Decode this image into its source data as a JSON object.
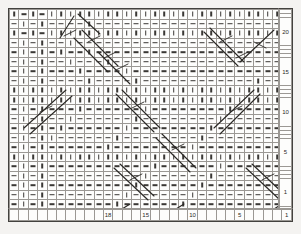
{
  "chart": {
    "type": "stitch-chart",
    "columns": 30,
    "rows": 22,
    "symbols": {
      "purl": "—",
      "knit": "|",
      "blank": ""
    },
    "legend": {
      "purl_label": "purl",
      "knit_label": "knit",
      "cable_label": "cable cross"
    },
    "row_number_labels": [
      "",
      "",
      "20",
      "",
      "",
      "",
      "15",
      "",
      "",
      "",
      "10",
      "",
      "",
      "",
      "5",
      "",
      "",
      "",
      "1",
      "",
      "",
      ""
    ],
    "column_number_labels": [
      "",
      "",
      "",
      "",
      "",
      "",
      "",
      "",
      "",
      "",
      "18",
      "",
      "",
      "",
      "15",
      "",
      "",
      "",
      "",
      "10",
      "",
      "",
      "",
      "",
      "5",
      "",
      "",
      "",
      "",
      "1"
    ],
    "grid": [
      [
        "|",
        "—",
        "|",
        "—",
        "|",
        "|",
        "|",
        "|",
        "|",
        "|",
        "|",
        "|",
        "|",
        "|",
        "|",
        "|",
        "|",
        "|",
        "|",
        "|",
        "|",
        "|",
        "|",
        "|",
        "|",
        "|",
        "|",
        "|",
        "|",
        "|"
      ],
      [
        "—",
        "|",
        "—",
        "|",
        "—",
        "—",
        "—",
        "—",
        "|",
        "—",
        "—",
        "—",
        "—",
        "—",
        "—",
        "—",
        "—",
        "—",
        "—",
        "—",
        "—",
        "—",
        "—",
        "—",
        "—",
        "—",
        "—",
        "—",
        "—",
        "—"
      ],
      [
        "|",
        "—",
        "|",
        "—",
        "|",
        "|",
        "|",
        "|",
        "|",
        "|",
        "|",
        "|",
        "|",
        "|",
        "|",
        "|",
        "|",
        "|",
        "|",
        "|",
        "|",
        "|",
        "|",
        "|",
        "|",
        "|",
        "|",
        "|",
        "|",
        "|"
      ],
      [
        "—",
        "|",
        "—",
        "|",
        "—",
        "—",
        "|",
        "—",
        "—",
        "—",
        "—",
        "—",
        "—",
        "—",
        "—",
        "—",
        "—",
        "—",
        "—",
        "—",
        "—",
        "—",
        "—",
        "—",
        "—",
        "—",
        "—",
        "—",
        "—",
        "—"
      ],
      [
        "—",
        "|",
        "—",
        "|",
        "—",
        "|",
        "—",
        "—",
        "|",
        "—",
        "—",
        "—",
        "—",
        "—",
        "—",
        "—",
        "—",
        "—",
        "—",
        "—",
        "—",
        "—",
        "—",
        "—",
        "—",
        "—",
        "—",
        "—",
        "—",
        "—"
      ],
      [
        "—",
        "|",
        "—",
        "|",
        "—",
        "—",
        "|",
        "—",
        "—",
        "—",
        "|",
        "—",
        "—",
        "—",
        "—",
        "—",
        "—",
        "—",
        "—",
        "—",
        "—",
        "—",
        "—",
        "—",
        "—",
        "—",
        "—",
        "—",
        "—",
        "—"
      ],
      [
        "—",
        "|",
        "—",
        "|",
        "—",
        "—",
        "—",
        "|",
        "—",
        "—",
        "—",
        "—",
        "|",
        "—",
        "—",
        "—",
        "—",
        "—",
        "—",
        "—",
        "—",
        "—",
        "—",
        "—",
        "—",
        "—",
        "—",
        "—",
        "—",
        "—"
      ],
      [
        "—",
        "|",
        "—",
        "|",
        "—",
        "—",
        "—",
        "—",
        "|",
        "—",
        "—",
        "—",
        "—",
        "|",
        "—",
        "—",
        "—",
        "—",
        "—",
        "—",
        "—",
        "—",
        "—",
        "—",
        "—",
        "—",
        "|",
        "—",
        "—",
        "—"
      ],
      [
        "|",
        "|",
        "|",
        "|",
        "|",
        "|",
        "|",
        "|",
        "|",
        "|",
        "|",
        "|",
        "|",
        "|",
        "|",
        "|",
        "|",
        "|",
        "|",
        "|",
        "|",
        "|",
        "|",
        "|",
        "|",
        "|",
        "|",
        "|",
        "|",
        "|"
      ],
      [
        "|",
        "|",
        "|",
        "|",
        "|",
        "|",
        "|",
        "|",
        "|",
        "|",
        "|",
        "|",
        "|",
        "|",
        "|",
        "|",
        "|",
        "|",
        "|",
        "|",
        "|",
        "|",
        "|",
        "|",
        "|",
        "|",
        "|",
        "|",
        "|",
        "|"
      ],
      [
        "—",
        "|",
        "—",
        "|",
        "—",
        "—",
        "—",
        "|",
        "—",
        "—",
        "—",
        "—",
        "—",
        "—",
        "|",
        "—",
        "—",
        "—",
        "—",
        "—",
        "—",
        "—",
        "—",
        "|",
        "—",
        "—",
        "—",
        "—",
        "—",
        "—"
      ],
      [
        "—",
        "|",
        "—",
        "|",
        "—",
        "—",
        "|",
        "—",
        "—",
        "—",
        "—",
        "—",
        "—",
        "|",
        "—",
        "—",
        "—",
        "—",
        "—",
        "—",
        "—",
        "—",
        "|",
        "—",
        "—",
        "—",
        "—",
        "—",
        "—",
        "—"
      ],
      [
        "—",
        "|",
        "—",
        "|",
        "—",
        "|",
        "—",
        "—",
        "—",
        "—",
        "—",
        "—",
        "|",
        "—",
        "—",
        "—",
        "—",
        "—",
        "—",
        "—",
        "—",
        "|",
        "—",
        "—",
        "—",
        "—",
        "—",
        "—",
        "—",
        "—"
      ],
      [
        "—",
        "|",
        "—",
        "|",
        "|",
        "—",
        "—",
        "—",
        "—",
        "—",
        "—",
        "|",
        "—",
        "—",
        "—",
        "—",
        "—",
        "—",
        "—",
        "—",
        "|",
        "—",
        "—",
        "—",
        "—",
        "—",
        "—",
        "—",
        "—",
        "—"
      ],
      [
        "—",
        "|",
        "—",
        "|",
        "—",
        "—",
        "—",
        "—",
        "—",
        "—",
        "|",
        "—",
        "—",
        "—",
        "—",
        "—",
        "—",
        "—",
        "—",
        "|",
        "—",
        "—",
        "—",
        "—",
        "—",
        "—",
        "—",
        "—",
        "—",
        "—"
      ],
      [
        "|",
        "|",
        "|",
        "|",
        "|",
        "|",
        "|",
        "|",
        "|",
        "|",
        "|",
        "|",
        "|",
        "|",
        "|",
        "|",
        "|",
        "|",
        "|",
        "|",
        "|",
        "|",
        "|",
        "|",
        "|",
        "|",
        "|",
        "|",
        "|",
        "|"
      ],
      [
        "—",
        "|",
        "—",
        "|",
        "—",
        "—",
        "—",
        "—",
        "—",
        "—",
        "—",
        "—",
        "—",
        "—",
        "—",
        "|",
        "—",
        "—",
        "—",
        "—",
        "—",
        "—",
        "|",
        "—",
        "—",
        "—",
        "—",
        "—",
        "—",
        "—"
      ],
      [
        "—",
        "|",
        "—",
        "|",
        "—",
        "—",
        "—",
        "—",
        "—",
        "—",
        "—",
        "—",
        "—",
        "—",
        "|",
        "—",
        "—",
        "—",
        "—",
        "—",
        "—",
        "|",
        "—",
        "—",
        "—",
        "—",
        "—",
        "—",
        "—",
        "—"
      ],
      [
        "—",
        "|",
        "—",
        "|",
        "—",
        "—",
        "—",
        "—",
        "—",
        "—",
        "—",
        "—",
        "—",
        "|",
        "—",
        "—",
        "—",
        "—",
        "—",
        "—",
        "|",
        "—",
        "—",
        "—",
        "—",
        "—",
        "—",
        "—",
        "—",
        "—"
      ],
      [
        "—",
        "|",
        "—",
        "|",
        "—",
        "—",
        "—",
        "—",
        "—",
        "—",
        "—",
        "—",
        "|",
        "—",
        "—",
        "—",
        "—",
        "—",
        "—",
        "|",
        "—",
        "—",
        "—",
        "—",
        "—",
        "—",
        "—",
        "—",
        "—",
        "—"
      ],
      [
        "—",
        "|",
        "—",
        "|",
        "—",
        "—",
        "—",
        "—",
        "—",
        "—",
        "—",
        "|",
        "—",
        "—",
        "—",
        "—",
        "—",
        "—",
        "|",
        "—",
        "—",
        "—",
        "—",
        "—",
        "—",
        "—",
        "—",
        "—",
        "—",
        "—"
      ],
      [
        "|",
        "|",
        "|",
        "|",
        "|",
        "|",
        "|",
        "|",
        "|",
        "|",
        "|",
        "|",
        "|",
        "|",
        "|",
        "|",
        "|",
        "|",
        "|",
        "|",
        "|",
        "|",
        "|",
        "|",
        "|",
        "|",
        "|",
        "|",
        "|",
        "|"
      ]
    ],
    "cables": [
      {
        "x1": 66,
        "y1": 8,
        "x2": 52,
        "y2": 30
      },
      {
        "x1": 70,
        "y1": 6,
        "x2": 92,
        "y2": 26
      },
      {
        "x1": 74,
        "y1": 22,
        "x2": 110,
        "y2": 58
      },
      {
        "x1": 66,
        "y1": 30,
        "x2": 100,
        "y2": 64
      },
      {
        "x1": 90,
        "y1": 44,
        "x2": 122,
        "y2": 76
      },
      {
        "x1": 196,
        "y1": 24,
        "x2": 230,
        "y2": 58
      },
      {
        "x1": 202,
        "y1": 20,
        "x2": 236,
        "y2": 54
      },
      {
        "x1": 232,
        "y1": 54,
        "x2": 266,
        "y2": 22
      },
      {
        "x1": 16,
        "y1": 120,
        "x2": 58,
        "y2": 82
      },
      {
        "x1": 22,
        "y1": 126,
        "x2": 64,
        "y2": 88
      },
      {
        "x1": 108,
        "y1": 86,
        "x2": 146,
        "y2": 124
      },
      {
        "x1": 114,
        "y1": 82,
        "x2": 152,
        "y2": 120
      },
      {
        "x1": 206,
        "y1": 120,
        "x2": 246,
        "y2": 82
      },
      {
        "x1": 212,
        "y1": 126,
        "x2": 252,
        "y2": 86
      },
      {
        "x1": 148,
        "y1": 130,
        "x2": 182,
        "y2": 164
      },
      {
        "x1": 154,
        "y1": 126,
        "x2": 188,
        "y2": 160
      },
      {
        "x1": 106,
        "y1": 160,
        "x2": 140,
        "y2": 192
      },
      {
        "x1": 112,
        "y1": 156,
        "x2": 146,
        "y2": 188
      },
      {
        "x1": 238,
        "y1": 160,
        "x2": 272,
        "y2": 192
      },
      {
        "x1": 244,
        "y1": 156,
        "x2": 278,
        "y2": 188
      },
      {
        "x1": 122,
        "y1": 196,
        "x2": 106,
        "y2": 206
      },
      {
        "x1": 160,
        "y1": 206,
        "x2": 176,
        "y2": 196
      },
      {
        "x1": 258,
        "y1": 206,
        "x2": 274,
        "y2": 196
      }
    ],
    "cable_ticks": [
      {
        "x1": 56,
        "y1": 28,
        "x2": 68,
        "y2": 22
      },
      {
        "x1": 80,
        "y1": 34,
        "x2": 92,
        "y2": 28
      },
      {
        "x1": 96,
        "y1": 50,
        "x2": 108,
        "y2": 44
      },
      {
        "x1": 108,
        "y1": 62,
        "x2": 120,
        "y2": 56
      },
      {
        "x1": 212,
        "y1": 34,
        "x2": 224,
        "y2": 28
      },
      {
        "x1": 228,
        "y1": 50,
        "x2": 240,
        "y2": 44
      },
      {
        "x1": 246,
        "y1": 34,
        "x2": 258,
        "y2": 40
      },
      {
        "x1": 32,
        "y1": 104,
        "x2": 44,
        "y2": 98
      },
      {
        "x1": 124,
        "y1": 100,
        "x2": 136,
        "y2": 94
      },
      {
        "x1": 222,
        "y1": 104,
        "x2": 234,
        "y2": 98
      },
      {
        "x1": 164,
        "y1": 142,
        "x2": 176,
        "y2": 136
      },
      {
        "x1": 122,
        "y1": 172,
        "x2": 134,
        "y2": 166
      },
      {
        "x1": 254,
        "y1": 172,
        "x2": 266,
        "y2": 166
      }
    ]
  }
}
